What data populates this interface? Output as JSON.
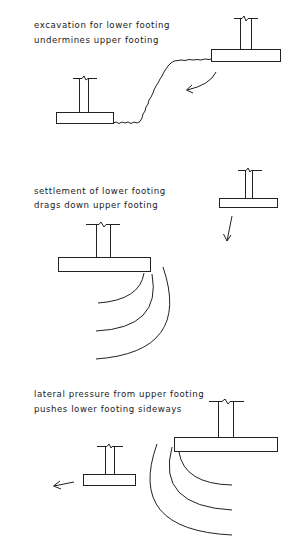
{
  "diagram": {
    "panels": [
      {
        "id": "excavation",
        "caption_line1": "excavation for lower footing",
        "caption_line2": "undermines upper footing",
        "elements": [
          "upper-footing",
          "lower-footing",
          "excavation-slope",
          "rotation-arrow"
        ]
      },
      {
        "id": "settlement",
        "caption_line1": "settlement of lower footing",
        "caption_line2": "drags down upper footing",
        "elements": [
          "upper-footing",
          "lower-footing",
          "settlement-arcs",
          "downward-arrow"
        ]
      },
      {
        "id": "lateral-pressure",
        "caption_line1": "lateral pressure from upper footing",
        "caption_line2": "pushes lower footing sideways",
        "elements": [
          "upper-footing",
          "lower-footing",
          "pressure-arcs",
          "sideways-arrow"
        ]
      }
    ],
    "colors": {
      "ink": "#222222",
      "background": "#ffffff"
    }
  }
}
